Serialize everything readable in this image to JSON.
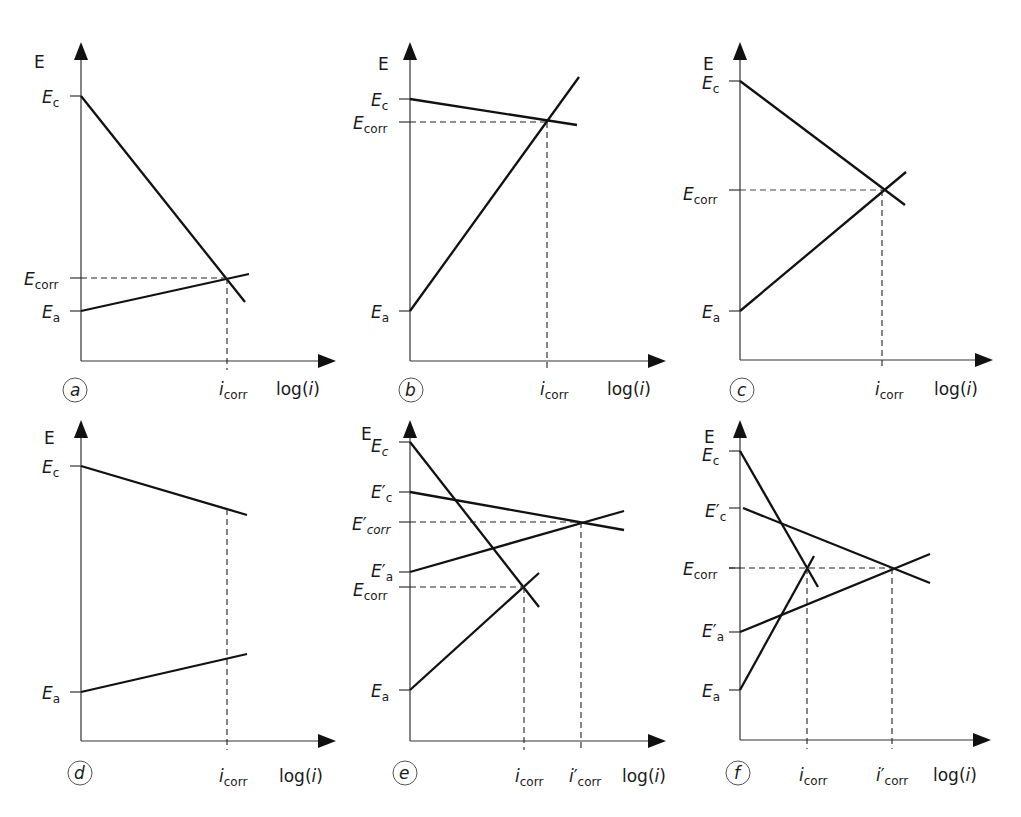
{
  "figure": {
    "colors": {
      "line": "#111111",
      "background": "#ffffff"
    },
    "common": {
      "y_axis_label": "E",
      "x_axis_label": "log(i)",
      "x_axis_label_prefix": "log(",
      "x_axis_label_var": "i",
      "x_axis_label_suffix": ")"
    },
    "panels": [
      {
        "id": "a",
        "label": "a",
        "y_ticks": [
          "Ec",
          "Ecorr",
          "Ea"
        ],
        "x_ticks": [
          "icorr"
        ]
      },
      {
        "id": "b",
        "label": "b",
        "y_ticks": [
          "Ec",
          "Ecorr",
          "Ea"
        ],
        "x_ticks": [
          "icorr"
        ]
      },
      {
        "id": "c",
        "label": "c",
        "y_ticks": [
          "Ec",
          "Ecorr",
          "Ea"
        ],
        "x_ticks": [
          "icorr"
        ]
      },
      {
        "id": "d",
        "label": "d",
        "y_ticks": [
          "Ec",
          "Ea"
        ],
        "x_ticks": [
          "icorr"
        ]
      },
      {
        "id": "e",
        "label": "e",
        "y_ticks": [
          "Ec",
          "E'c",
          "E'corr",
          "E'a",
          "Ecorr",
          "Ea"
        ],
        "x_ticks": [
          "icorr",
          "i'corr"
        ]
      },
      {
        "id": "f",
        "label": "f",
        "y_ticks": [
          "Ec",
          "E'c",
          "Ecorr",
          "E'a",
          "Ea"
        ],
        "x_ticks": [
          "icorr",
          "i'corr"
        ]
      }
    ]
  },
  "text": {
    "E": "E",
    "E_main": "E",
    "sub_c": "c",
    "sub_a": "a",
    "sub_corr": "corr",
    "prime": "′",
    "i": "i",
    "logi_pre": "log(",
    "logi_var": "i",
    "logi_post": ")",
    "pa": "a",
    "pb": "b",
    "pc": "c",
    "pd": "d",
    "pe": "e",
    "pf": "f"
  }
}
